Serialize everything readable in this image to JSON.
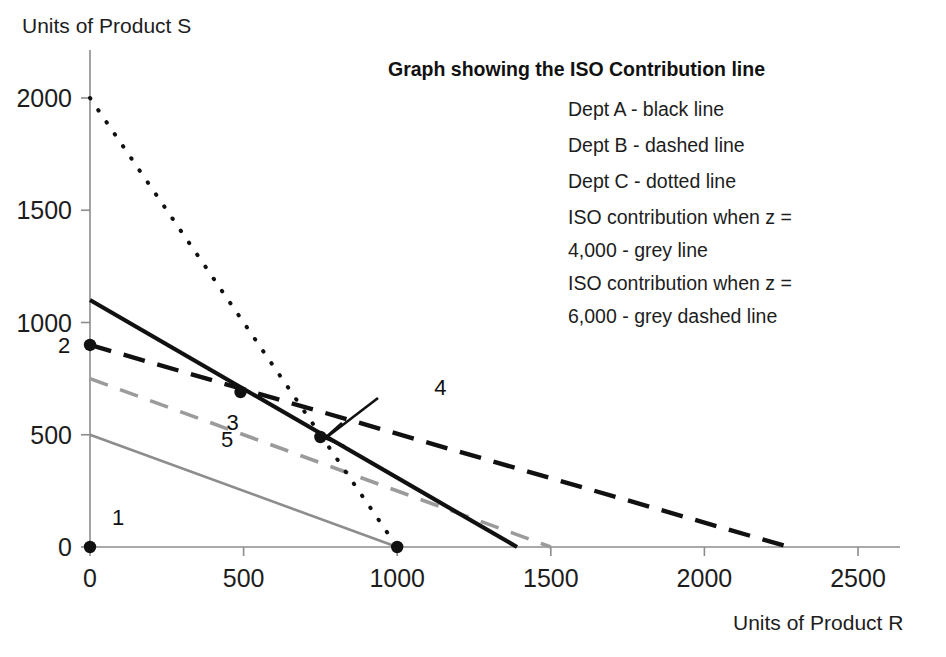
{
  "chart_data": {
    "type": "line",
    "title": "Graph showing the ISO Contribution line",
    "xlabel": "Units of Product R",
    "ylabel": "Units of Product S",
    "xlim": [
      0,
      2600
    ],
    "ylim": [
      0,
      2150
    ],
    "xticks": [
      0,
      500,
      1000,
      1500,
      2000,
      2500
    ],
    "xticklabels": [
      "0",
      "500",
      "1000",
      "1500",
      "2000",
      "2500"
    ],
    "yticks": [
      0,
      500,
      1000,
      1500,
      2000
    ],
    "yticklabels": [
      "0",
      "500",
      "1000",
      "1500",
      "2000"
    ],
    "grid": false,
    "legend_position": "upper-right-inside",
    "series": [
      {
        "name": "Dept A",
        "style": "black line",
        "color": "#111111",
        "dash": "solid",
        "points": [
          [
            0,
            1100
          ],
          [
            1390,
            0
          ]
        ]
      },
      {
        "name": "Dept B",
        "style": "dashed line",
        "color": "#111111",
        "dash": "dashed",
        "points": [
          [
            0,
            900
          ],
          [
            2275,
            0
          ]
        ]
      },
      {
        "name": "Dept C",
        "style": "dotted line",
        "color": "#111111",
        "dash": "dotted",
        "points": [
          [
            0,
            2000
          ],
          [
            1000,
            0
          ]
        ]
      },
      {
        "name": "ISO contribution z = 4,000",
        "style": "grey line",
        "color": "#8d8d8d",
        "dash": "solid",
        "points": [
          [
            0,
            500
          ],
          [
            1000,
            0
          ]
        ]
      },
      {
        "name": "ISO contribution z = 6,000",
        "style": "grey dashed line",
        "color": "#9b9b9b",
        "dash": "dashed",
        "points": [
          [
            0,
            750
          ],
          [
            1500,
            0
          ]
        ]
      }
    ],
    "markers": [
      {
        "label": "1",
        "x": 0,
        "y": 0,
        "label_dx": 28,
        "label_dy": -22
      },
      {
        "label": "2",
        "x": 0,
        "y": 900,
        "label_dx": -26,
        "label_dy": 8
      },
      {
        "label": "3",
        "x": 490,
        "y": 690,
        "label_dx": -8,
        "label_dy": 38
      },
      {
        "label": "4",
        "x": 750,
        "y": 490,
        "label_dx": 120,
        "label_dy": -42
      },
      {
        "label": "5",
        "x": 1000,
        "y": 0,
        "label_dx": -170,
        "label_dy": -100
      }
    ],
    "annotations": [
      {
        "name": "arrow-to-point-4",
        "from_x": 760,
        "from_y": 540,
        "to_x": 760,
        "to_y": 500
      }
    ]
  },
  "legend": {
    "title": "Graph showing the ISO Contribution line",
    "lines": [
      "Dept A - black line",
      "Dept B - dashed line",
      "Dept C - dotted line",
      "ISO contribution when z =",
      "4,000 - grey line",
      "ISO contribution when z =",
      "6,000 - grey dashed line"
    ]
  },
  "axes": {
    "y_title": "Units of Product S",
    "x_title": "Units of Product R"
  }
}
